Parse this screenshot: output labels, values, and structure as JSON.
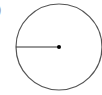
{
  "figure": {
    "label": ")",
    "circle": {
      "cx": 59,
      "cy": 47,
      "r": 43,
      "stroke": "#555555"
    },
    "radius_line": {
      "x1": 16,
      "y1": 47,
      "x2": 59,
      "y2": 47,
      "stroke": "#333333"
    },
    "center_dot": {
      "cx": 59,
      "cy": 47,
      "r": 2,
      "fill": "#000000"
    }
  }
}
